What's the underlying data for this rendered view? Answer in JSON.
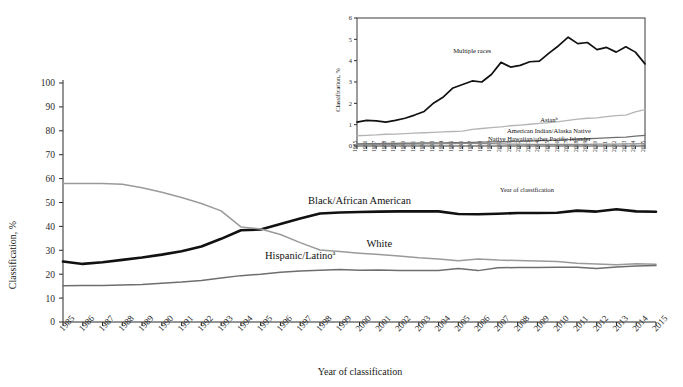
{
  "figure": {
    "background_color": "#ffffff",
    "width": 683,
    "height": 387
  },
  "chart_data": [
    {
      "id": "main",
      "type": "line",
      "title": "",
      "xlabel": "Year of classification",
      "ylabel": "Classification, %",
      "xlim": [
        1985,
        2015
      ],
      "ylim": [
        0,
        100
      ],
      "ytick_step": 10,
      "grid": false,
      "legend_position": "inline-annotations",
      "x": [
        1985,
        1986,
        1987,
        1988,
        1989,
        1990,
        1991,
        1992,
        1993,
        1994,
        1995,
        1996,
        1997,
        1998,
        1999,
        2000,
        2001,
        2002,
        2003,
        2004,
        2005,
        2006,
        2007,
        2008,
        2009,
        2010,
        2011,
        2012,
        2013,
        2014,
        2015
      ],
      "xticklabels": [
        "1985",
        "1986",
        "1987",
        "1988",
        "1989",
        "1990",
        "1991",
        "1992",
        "1993",
        "1994",
        "1995",
        "1996",
        "1997",
        "1998",
        "1999",
        "2000",
        "2001",
        "2002",
        "2003",
        "2004",
        "2005",
        "2006",
        "2007",
        "2008",
        "2009",
        "2010",
        "2011",
        "2012",
        "2013",
        "2014",
        "2015"
      ],
      "yticklabels": [
        "0",
        "10",
        "20",
        "30",
        "40",
        "50",
        "60",
        "70",
        "80",
        "90",
        "100"
      ],
      "series": [
        {
          "name": "Black/African American",
          "label": "Black/African American",
          "label_superscript": "",
          "color": "#111111",
          "linewidth": 2.6,
          "label_x": 2000,
          "label_y": 49.5,
          "values": [
            25.3,
            24.3,
            25.0,
            26.0,
            27.0,
            28.2,
            29.6,
            31.6,
            34.8,
            38.4,
            38.7,
            41.0,
            43.3,
            45.4,
            45.8,
            46.0,
            46.2,
            46.3,
            46.3,
            46.3,
            45.2,
            45.1,
            45.3,
            45.6,
            45.6,
            45.7,
            46.6,
            46.2,
            47.2,
            46.3,
            46.1
          ]
        },
        {
          "name": "White",
          "label": "White",
          "label_superscript": "",
          "color": "#9a9a9a",
          "linewidth": 1.5,
          "label_x": 2001,
          "label_y": 31.5,
          "values": [
            57.9,
            58.0,
            58.0,
            57.6,
            56.2,
            54.3,
            52.1,
            49.6,
            46.5,
            39.8,
            38.9,
            36.6,
            33.2,
            30.1,
            29.5,
            28.8,
            28.2,
            27.6,
            26.9,
            26.4,
            25.6,
            26.4,
            25.9,
            25.7,
            25.5,
            25.3,
            24.6,
            24.3,
            24.0,
            24.4,
            24.2
          ]
        },
        {
          "name": "Hispanic/Latino",
          "label": "Hispanic/Latino",
          "label_superscript": "a",
          "color": "#6e6e6e",
          "linewidth": 1.5,
          "label_x": 1997,
          "label_y": 26.5,
          "values": [
            15.2,
            15.3,
            15.3,
            15.5,
            15.7,
            16.2,
            16.7,
            17.4,
            18.4,
            19.4,
            20.0,
            20.8,
            21.3,
            21.7,
            22.0,
            21.7,
            21.8,
            21.6,
            21.6,
            21.6,
            22.4,
            21.5,
            22.7,
            22.8,
            22.8,
            22.9,
            22.9,
            22.4,
            23.0,
            23.4,
            23.6
          ]
        }
      ]
    },
    {
      "id": "inset",
      "type": "line",
      "title": "",
      "xlabel": "Year of classification",
      "ylabel": "Classification, %",
      "xlim": [
        1985,
        2015
      ],
      "ylim": [
        0,
        6
      ],
      "ytick_step": 1,
      "grid": false,
      "legend_position": "inline-annotations",
      "x": [
        1985,
        1986,
        1987,
        1988,
        1989,
        1990,
        1991,
        1992,
        1993,
        1994,
        1995,
        1996,
        1997,
        1998,
        1999,
        2000,
        2001,
        2002,
        2003,
        2004,
        2005,
        2006,
        2007,
        2008,
        2009,
        2010,
        2011,
        2012,
        2013,
        2014,
        2015
      ],
      "xticklabels": [
        "1985",
        "1986",
        "1987",
        "1988",
        "1989",
        "1990",
        "1991",
        "1992",
        "1993",
        "1994",
        "1995",
        "1996",
        "1997",
        "1998",
        "1999",
        "2000",
        "2001",
        "2002",
        "2003",
        "2004",
        "2005",
        "2006",
        "2007",
        "2008",
        "2009",
        "2010",
        "2011",
        "2012",
        "2013",
        "2014",
        "2015"
      ],
      "yticklabels": [
        "0",
        "1",
        "2",
        "3",
        "4",
        "5",
        "6"
      ],
      "series": [
        {
          "name": "Multiple races",
          "label": "Multiple races",
          "label_superscript": "",
          "color": "#111111",
          "linewidth": 1.7,
          "label_x": 1997,
          "label_y": 4.35,
          "values": [
            1.12,
            1.2,
            1.18,
            1.12,
            1.2,
            1.3,
            1.45,
            1.62,
            2.02,
            2.3,
            2.72,
            2.88,
            3.05,
            3.0,
            3.35,
            3.92,
            3.7,
            3.78,
            3.95,
            3.98,
            4.35,
            4.7,
            5.1,
            4.8,
            4.85,
            4.52,
            4.62,
            4.4,
            4.65,
            4.4,
            3.85
          ]
        },
        {
          "name": "Asian",
          "label": "Asian",
          "label_superscript": "b",
          "color": "#b4b4b4",
          "linewidth": 1.3,
          "label_x": 2005,
          "label_y": 1.12,
          "values": [
            0.48,
            0.5,
            0.52,
            0.55,
            0.56,
            0.58,
            0.6,
            0.62,
            0.64,
            0.66,
            0.68,
            0.7,
            0.78,
            0.82,
            0.86,
            0.9,
            0.95,
            0.98,
            1.02,
            1.06,
            1.1,
            1.14,
            1.2,
            1.26,
            1.3,
            1.32,
            1.38,
            1.42,
            1.45,
            1.6,
            1.7
          ]
        },
        {
          "name": "American Indian/Alaska Native",
          "label": "American Indian/Alaska Native",
          "label_superscript": "",
          "color": "#6e6e6e",
          "linewidth": 1.3,
          "label_x": 2005,
          "label_y": 0.62,
          "values": [
            0.1,
            0.11,
            0.11,
            0.12,
            0.12,
            0.13,
            0.13,
            0.14,
            0.14,
            0.15,
            0.16,
            0.16,
            0.17,
            0.18,
            0.19,
            0.2,
            0.21,
            0.22,
            0.23,
            0.25,
            0.26,
            0.28,
            0.3,
            0.32,
            0.34,
            0.36,
            0.38,
            0.4,
            0.42,
            0.46,
            0.5
          ]
        },
        {
          "name": "Native Hawaiian/other Pacific Islander",
          "label": "Native Hawaiian/other Pacific Islander",
          "label_superscript": "",
          "color": "#8c8c8c",
          "linewidth": 1.3,
          "label_x": 2004,
          "label_y": 0.24,
          "values": [
            0.06,
            0.07,
            0.07,
            0.08,
            0.08,
            0.09,
            0.09,
            0.1,
            0.1,
            0.11,
            0.11,
            0.12,
            0.12,
            0.11,
            0.11,
            0.1,
            0.09,
            0.09,
            0.08,
            0.08,
            0.08,
            0.08,
            0.08,
            0.08,
            0.08,
            0.09,
            0.09,
            0.09,
            0.1,
            0.1,
            0.11
          ]
        }
      ]
    }
  ]
}
